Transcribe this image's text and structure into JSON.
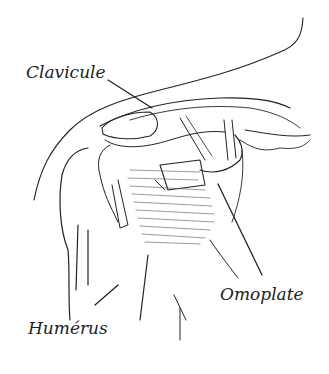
{
  "diagram": {
    "labels": {
      "clavicle": "Clavicule",
      "scapula": "Omoplate",
      "humerus": "Humérus"
    },
    "colors": {
      "ink": "#222222",
      "shade": "#555555",
      "background": "#ffffff"
    }
  }
}
